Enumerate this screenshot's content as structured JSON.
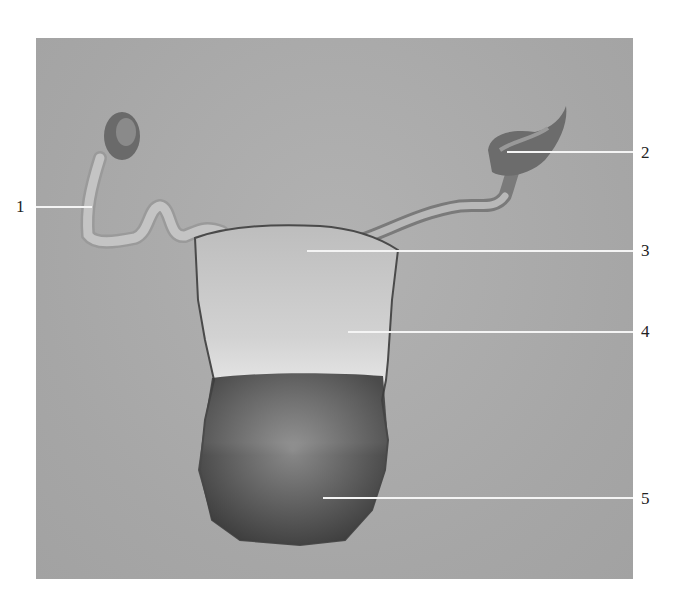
{
  "figure": {
    "background_color": "#a8a8a8",
    "label_color": "#222222",
    "leader_color": "#f4f4f4"
  },
  "labels": [
    {
      "id": "1",
      "text": "1",
      "side": "left"
    },
    {
      "id": "2",
      "text": "2",
      "side": "right"
    },
    {
      "id": "3",
      "text": "3",
      "side": "right"
    },
    {
      "id": "4",
      "text": "4",
      "side": "right"
    },
    {
      "id": "5",
      "text": "5",
      "side": "right"
    }
  ]
}
